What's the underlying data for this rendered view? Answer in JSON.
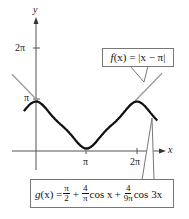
{
  "chart_data": {
    "type": "line",
    "title": "",
    "xlabel": "x",
    "ylabel": "y",
    "x_ticks": [
      {
        "value": 3.14159,
        "label": "π"
      },
      {
        "value": 6.28318,
        "label": "2π"
      }
    ],
    "y_ticks": [
      {
        "value": 3.14159,
        "label": "π"
      },
      {
        "value": 6.28318,
        "label": "2π"
      }
    ],
    "xlim": [
      -0.75,
      7.7
    ],
    "ylim": [
      0,
      7.5
    ],
    "grid": false,
    "series": [
      {
        "name": "f(x) = |x − π|",
        "style": "gray thin line",
        "color": "#9a9a9a",
        "x": [
          -1.25,
          0,
          3.14159,
          6.28318,
          7.3
        ],
        "y": [
          4.39,
          3.14,
          0,
          3.14,
          4.16
        ]
      },
      {
        "name": "g(x) = π/2 + (4/π) cos x + (4/(9π)) cos 3x",
        "style": "black thick curve",
        "color": "#111111",
        "x": [
          -0.75,
          0,
          0.785,
          1.571,
          2.356,
          3.14159,
          3.927,
          4.712,
          5.498,
          6.28318,
          7.07,
          7.55
        ],
        "y": [
          2.05,
          3.0,
          2.27,
          1.57,
          0.87,
          0.16,
          0.87,
          1.57,
          2.27,
          3.0,
          2.27,
          1.87
        ]
      }
    ],
    "annotations": [
      {
        "text": "f(x) = |x − π|",
        "points_to": "f(x) near x ≈ 2π"
      },
      {
        "text": "g(x) = π/2 + 4/π cos x + 4/(9π) cos 3x",
        "points_to": "g(x) near x ≈ 2π + 1"
      }
    ]
  },
  "axes": {
    "x_label": "x",
    "y_label": "y",
    "x_tick_pi": "π",
    "x_tick_2pi": "2π",
    "y_tick_pi": "π",
    "y_tick_2pi": "2π"
  },
  "callouts": {
    "f": {
      "name": "f",
      "paren": "(x)",
      "eq": " = |x − π|"
    },
    "g": {
      "lhs_name": "g",
      "lhs_paren": "(x) =",
      "t1_num": "π",
      "t1_den": "2",
      "plus1": "+",
      "t2_num": "4",
      "t2_den": "π",
      "t2_tail": "cos x",
      "plus2": "+",
      "t3_num": "4",
      "t3_den": "9π",
      "t3_tail": "cos 3x"
    }
  },
  "colors": {
    "axis": "#555555",
    "f_line": "#9a9a9a",
    "g_curve": "#111111",
    "callout_border": "#777777"
  }
}
